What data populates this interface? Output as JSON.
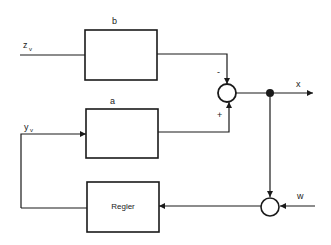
{
  "diagram": {
    "type": "block-diagram",
    "blocks": [
      {
        "id": "b",
        "label": "b"
      },
      {
        "id": "a",
        "label": "a"
      },
      {
        "id": "regler",
        "label": "Regler"
      }
    ],
    "signals": {
      "zv": "z",
      "zv_sub": "v",
      "yv": "y",
      "yv_sub": "v",
      "x": "x",
      "w": "w"
    },
    "sum_signs": {
      "top": "-",
      "bottom": "+"
    },
    "colors": {
      "line": "#1a1a1a",
      "background": "#ffffff"
    }
  }
}
